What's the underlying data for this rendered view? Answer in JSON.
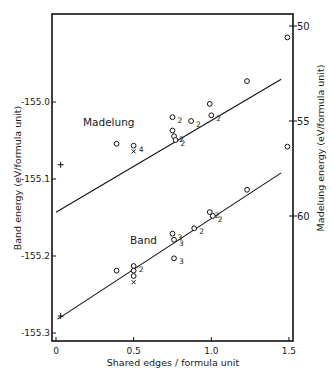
{
  "chart_data": {
    "type": "scatter",
    "title": "",
    "xlabel": "Shared edges / formula unit",
    "ylabel": "Band energy (eV/formula unit)",
    "y2label": "Madelung energy (eV/formula unit)",
    "xlim": [
      0,
      1.5
    ],
    "ylim": [
      -155.3,
      -154.88
    ],
    "y2lim": [
      47.5,
      68
    ],
    "y2_inverted": true,
    "grid": false,
    "legend": "none",
    "x_ticks": [
      "0",
      "0.5",
      "1.0",
      "1.5"
    ],
    "x_tick_values": [
      0,
      0.5,
      1.0,
      1.5
    ],
    "y_ticks": [
      "-155.0",
      "-155.1",
      "-155.2",
      "-155.3"
    ],
    "y_tick_values": [
      -155.0,
      -155.1,
      -155.2,
      -155.3
    ],
    "y2_ticks": [
      "50",
      "55",
      "60"
    ],
    "y2_tick_values": [
      50,
      55,
      60
    ],
    "annotations": [
      "Madelung",
      "Band"
    ],
    "series": [
      {
        "name": "Madelung",
        "axis": "right",
        "points": [
          {
            "x": 0.03,
            "y": 57.3,
            "marker": "+",
            "label": ""
          },
          {
            "x": 0.39,
            "y": 56.2,
            "marker": "o",
            "label": ""
          },
          {
            "x": 0.5,
            "y": 56.3,
            "marker": "o",
            "label": "4"
          },
          {
            "x": 0.5,
            "y": 56.6,
            "marker": "x",
            "label": ""
          },
          {
            "x": 0.75,
            "y": 54.8,
            "marker": "o",
            "label": "2"
          },
          {
            "x": 0.75,
            "y": 55.5,
            "marker": "o",
            "label": ""
          },
          {
            "x": 0.76,
            "y": 55.8,
            "marker": "o",
            "label": "2"
          },
          {
            "x": 0.77,
            "y": 56.0,
            "marker": "o",
            "label": "2"
          },
          {
            "x": 0.87,
            "y": 55.0,
            "marker": "o",
            "label": "2"
          },
          {
            "x": 0.99,
            "y": 54.1,
            "marker": "o",
            "label": ""
          },
          {
            "x": 1.0,
            "y": 54.7,
            "marker": "o",
            "label": "2"
          },
          {
            "x": 1.23,
            "y": 52.9,
            "marker": "o",
            "label": ""
          },
          {
            "x": 1.49,
            "y": 50.6,
            "marker": "o",
            "label": ""
          }
        ],
        "fit_line": {
          "x": [
            0,
            1.45
          ],
          "y": [
            59.8,
            52.8
          ]
        }
      },
      {
        "name": "Band",
        "axis": "left",
        "points": [
          {
            "x": 0.03,
            "y": -155.278,
            "marker": "+",
            "label": ""
          },
          {
            "x": 0.39,
            "y": -155.219,
            "marker": "o",
            "label": ""
          },
          {
            "x": 0.5,
            "y": -155.213,
            "marker": "o",
            "label": "2"
          },
          {
            "x": 0.5,
            "y": -155.219,
            "marker": "o",
            "label": ""
          },
          {
            "x": 0.5,
            "y": -155.226,
            "marker": "o",
            "label": ""
          },
          {
            "x": 0.5,
            "y": -155.234,
            "marker": "x",
            "label": ""
          },
          {
            "x": 0.75,
            "y": -155.171,
            "marker": "o",
            "label": "3"
          },
          {
            "x": 0.76,
            "y": -155.179,
            "marker": "o",
            "label": "3"
          },
          {
            "x": 0.76,
            "y": -155.203,
            "marker": "o",
            "label": "3"
          },
          {
            "x": 0.89,
            "y": -155.164,
            "marker": "o",
            "label": "2"
          },
          {
            "x": 0.99,
            "y": -155.143,
            "marker": "o",
            "label": "2"
          },
          {
            "x": 1.01,
            "y": -155.148,
            "marker": "o",
            "label": "2"
          },
          {
            "x": 1.23,
            "y": -155.114,
            "marker": "o",
            "label": ""
          },
          {
            "x": 1.49,
            "y": -155.058,
            "marker": "o",
            "label": ""
          }
        ],
        "fit_line": {
          "x": [
            0.01,
            1.45
          ],
          "y": [
            -155.282,
            -155.092
          ]
        }
      }
    ]
  },
  "labels": {
    "xlabel": "Shared edges / formula unit",
    "ylabel": "Band energy  (eV/formula unit)",
    "y2label": "Madelung energy  (eV/formula unit)",
    "madelung": "Madelung",
    "band": "Band"
  }
}
